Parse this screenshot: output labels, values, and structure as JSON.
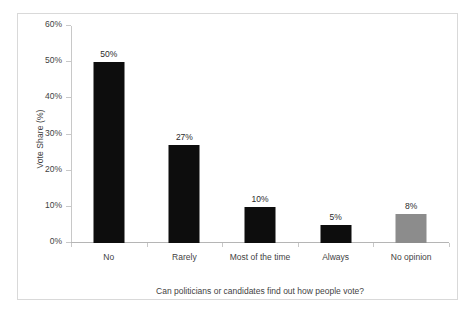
{
  "chart_data": {
    "type": "bar",
    "title": "",
    "xlabel": "Can politicians or candidates find out how people vote?",
    "ylabel": "Vote Share (%)",
    "categories": [
      "No",
      "Rarely",
      "Most of the time",
      "Always",
      "No opinion"
    ],
    "values": [
      50,
      27,
      10,
      5,
      8
    ],
    "data_labels": [
      "50%",
      "27%",
      "10%",
      "5%",
      "8%"
    ],
    "bar_colors": [
      "#0d0d0d",
      "#0d0d0d",
      "#0d0d0d",
      "#0d0d0d",
      "#8c8c8c"
    ],
    "ylim": [
      0,
      60
    ],
    "ytick_values": [
      0,
      10,
      20,
      30,
      40,
      50,
      60
    ],
    "ytick_labels": [
      "0%",
      "10%",
      "20%",
      "30%",
      "40%",
      "50%",
      "60%"
    ],
    "grid": false,
    "legend": null,
    "axis_color": "#c8c8c8",
    "text_color": "#3f3f3f",
    "frame_color": "#d9d9d9",
    "background": "#ffffff"
  }
}
